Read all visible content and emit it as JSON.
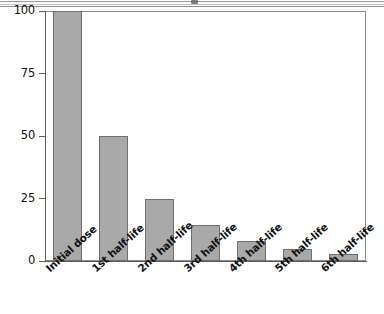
{
  "figure": {
    "title": "",
    "background_color": "#ffffff",
    "frame_color": "#8b8b8b",
    "axis_color": "#5d5d5d"
  },
  "artifacts": {
    "top_rule_label": "page-rule",
    "speck_label": "scan-speck"
  },
  "chart_data": {
    "type": "bar",
    "title": "",
    "subtitle": "",
    "xlabel": "",
    "ylabel": "",
    "categories": [
      "Initial dose",
      "1st half-life",
      "2nd half-life",
      "3rd half-life",
      "4th half-life",
      "5th half-life",
      "6th half-life"
    ],
    "values": [
      100,
      50,
      25,
      14.5,
      8,
      5,
      3
    ],
    "ylim": [
      0,
      100
    ],
    "xlim": [
      0,
      7
    ],
    "yticks": [
      0,
      25,
      50,
      75,
      100
    ],
    "ytick_labels": [
      "0",
      "25",
      "50",
      "75",
      "100"
    ],
    "grid": false,
    "legend": null,
    "legend_position": "none",
    "bar_color": "#a9a9a9",
    "bar_edge_color": "#6f6f6f",
    "annotations": []
  }
}
